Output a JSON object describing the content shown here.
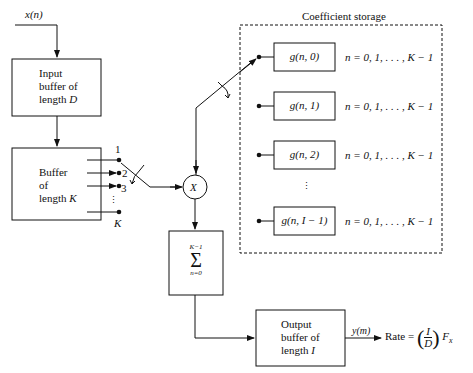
{
  "input_signal": {
    "label": "x(n)"
  },
  "input_buffer": {
    "line1": "Input",
    "line2": "buffer of",
    "line3_prefix": "length ",
    "line3_var": "D"
  },
  "k_buffer": {
    "line1": "Buffer",
    "line2": "of",
    "line3_prefix": "length ",
    "line3_var": "K"
  },
  "taps": {
    "labels": [
      "1",
      "2",
      "3",
      "K"
    ],
    "ellipsis": "⋮"
  },
  "multiplier": {
    "label": "X"
  },
  "coefficient_storage": {
    "title": "Coefficient storage",
    "rows": [
      {
        "label": "g(n, 0)",
        "range": "n = 0, 1, . . . , K − 1"
      },
      {
        "label": "g(n, 1)",
        "range": "n = 0, 1, . . . , K − 1"
      },
      {
        "label": "g(n, 2)",
        "range": "n = 0, 1, . . . , K − 1"
      },
      {
        "label": "g(n, I − 1)",
        "range": "n = 0, 1, . . . , K − 1"
      }
    ],
    "ellipsis": "⋮"
  },
  "summation": {
    "upper": "K−1",
    "symbol": "Σ",
    "lower": "n=0"
  },
  "output_buffer": {
    "line1": "Output",
    "line2": "buffer of",
    "line3_prefix": "length ",
    "line3_var": "I"
  },
  "output_signal": {
    "label": "y(m)"
  },
  "rate": {
    "prefix": "Rate  =",
    "numerator": "I",
    "denominator": "D",
    "suffix": "F",
    "suffix_sub": "x"
  }
}
